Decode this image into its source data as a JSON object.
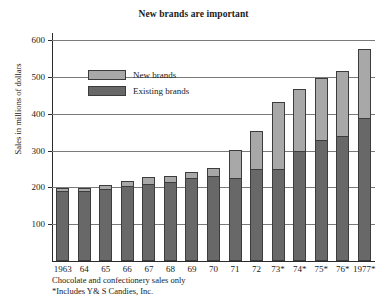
{
  "chart_data": {
    "type": "bar",
    "stacked": true,
    "title": "New brands are important",
    "xlabel": "",
    "ylabel": "Sales in millions of dollars",
    "ylim": [
      0,
      620
    ],
    "yticks": [
      100,
      200,
      300,
      400,
      500,
      600
    ],
    "grid": true,
    "legend_position": "inside-upper-left",
    "categories": [
      "1963",
      "64",
      "65",
      "66",
      "67",
      "68",
      "69",
      "70",
      "71",
      "72",
      "73*",
      "74*",
      "75*",
      "76*",
      "1977*"
    ],
    "series": [
      {
        "name": "Existing brands",
        "color": "#686868",
        "values": [
          190,
          190,
          195,
          205,
          210,
          215,
          225,
          230,
          225,
          250,
          250,
          300,
          330,
          340,
          390
        ]
      },
      {
        "name": "New brands",
        "color": "#a8a8a8",
        "values": [
          10,
          10,
          15,
          15,
          20,
          20,
          20,
          25,
          80,
          105,
          185,
          170,
          170,
          180,
          190
        ]
      }
    ],
    "totals": [
      200,
      200,
      210,
      220,
      230,
      235,
      245,
      255,
      305,
      355,
      435,
      470,
      500,
      520,
      580
    ],
    "annotations": [
      "Chocolate and confectionery sales only",
      "*Includes Y& S Candies, Inc."
    ]
  },
  "footnotes": {
    "line1": "Chocolate and confectionery sales only",
    "line2": "*Includes Y& S Candies, Inc."
  }
}
